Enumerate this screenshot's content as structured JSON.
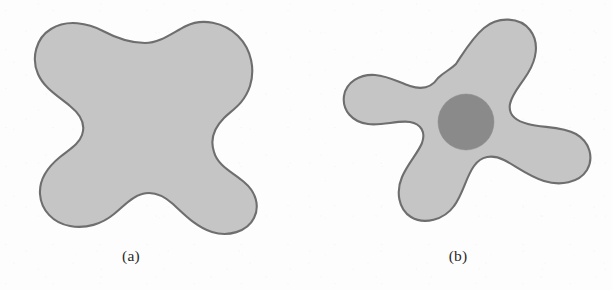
{
  "figure": {
    "background_color": "#fdfdfd",
    "shape_fill_color": "#c5c5c5",
    "shape_stroke_color": "#6e6e6e",
    "inner_circle_color": "#8a8a8a",
    "caption_color": "#2a2a2a",
    "panels": [
      {
        "id": "panel-a",
        "caption": "(a)",
        "shape_name": "simply-connected-blob",
        "has_inner_hole": false,
        "bounds": {
          "x": 22,
          "y": 22,
          "width": 236,
          "height": 211
        }
      },
      {
        "id": "panel-b",
        "caption": "(b)",
        "shape_name": "four-armed-star-blob-with-inner-disk",
        "has_inner_hole": true,
        "bounds": {
          "x": 54,
          "y": 22,
          "width": 230,
          "height": 206
        },
        "inner_circle": {
          "cx": 160,
          "cy": 122,
          "r": 28
        }
      }
    ]
  },
  "chart_data": {
    "type": "diagram",
    "title": "",
    "subtitle": "",
    "annotations": [
      "(a)",
      "(b)"
    ],
    "series": [
      {
        "name": "region-a",
        "fill": "#c5c5c5",
        "stroke": "#6e6e6e",
        "lobes": 4,
        "holes": 0,
        "centroid": [
          140,
          127
        ]
      },
      {
        "name": "region-b",
        "fill": "#c5c5c5",
        "stroke": "#6e6e6e",
        "lobes": 4,
        "holes": 1,
        "centroid": [
          466,
          125
        ],
        "hole_fill": "#8a8a8a",
        "hole_center": [
          466,
          122
        ],
        "hole_radius": 28
      }
    ],
    "grid": false,
    "legend": false,
    "xlabel": "",
    "ylabel": ""
  }
}
